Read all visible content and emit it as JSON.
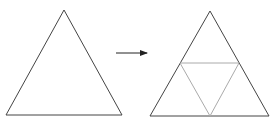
{
  "diagram": {
    "colors": {
      "outline": "#444444",
      "inner": "#aaaaaa",
      "arrow": "#222222",
      "background": "#ffffff"
    },
    "left_triangle": {
      "points": "64,10 6,115 122,115"
    },
    "arrow": {
      "x1": 116,
      "y1": 53,
      "x2": 147,
      "y2": 53
    },
    "right_triangle": {
      "points": "210,11 150,116 269,116"
    },
    "inner_triangle": {
      "points": "180,63 239,63 210,116"
    }
  }
}
